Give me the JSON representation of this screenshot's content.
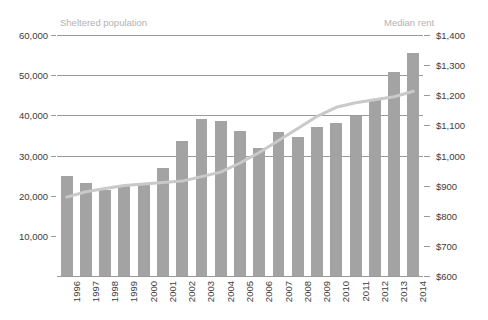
{
  "chart_data": {
    "type": "bar",
    "title": "",
    "subtitle": "",
    "xlabel": "",
    "grid": true,
    "legend_position": "top-inline",
    "categories": [
      "1996",
      "1997",
      "1998",
      "1999",
      "2000",
      "2001",
      "2002",
      "2003",
      "2004",
      "2005",
      "2006",
      "2007",
      "2008",
      "2009",
      "2010",
      "2011",
      "2012",
      "2013",
      "2014"
    ],
    "axes": {
      "left": {
        "label": "Sheltered population",
        "ticks": [
          "10,000",
          "20,000",
          "30,000",
          "40,000",
          "50,000",
          "60,000"
        ],
        "tick_values": [
          10000,
          20000,
          30000,
          40000,
          50000,
          60000
        ],
        "ylim": [
          0,
          60000
        ]
      },
      "right": {
        "label": "Median rent",
        "ticks": [
          "$600",
          "$700",
          "$800",
          "$900",
          "$1,000",
          "$1,100",
          "$1,200",
          "$1,300",
          "$1,400"
        ],
        "tick_values": [
          600,
          700,
          800,
          900,
          1000,
          1100,
          1200,
          1300,
          1400
        ],
        "ylim": [
          600,
          1400
        ]
      }
    },
    "series": [
      {
        "name": "Sheltered population",
        "type": "bar",
        "axis": "left",
        "color": "#a3a3a3",
        "values": [
          24800,
          23100,
          21500,
          22600,
          23000,
          27000,
          33500,
          39200,
          38700,
          36000,
          31800,
          35900,
          34700,
          37200,
          38000,
          39900,
          43700,
          50700,
          55500
        ]
      },
      {
        "name": "Median rent",
        "type": "line",
        "axis": "right",
        "color": "#c9c9c9",
        "values": [
          862,
          880,
          890,
          900,
          905,
          910,
          915,
          930,
          945,
          975,
          1010,
          1050,
          1090,
          1130,
          1160,
          1175,
          1185,
          1195,
          1213
        ]
      }
    ]
  },
  "legend": {
    "left_series": "Sheltered population",
    "right_series": "Median rent"
  }
}
